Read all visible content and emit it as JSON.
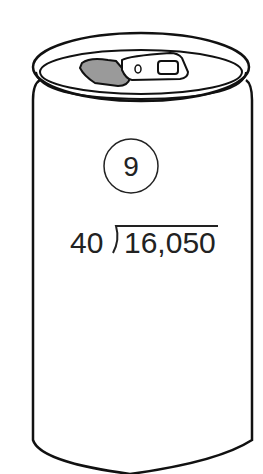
{
  "problem": {
    "number": "9",
    "divisor": "40",
    "dividend": "16,050"
  },
  "colors": {
    "stroke": "#111111",
    "tab_fill": "#9a9a9a",
    "background": "#ffffff"
  }
}
